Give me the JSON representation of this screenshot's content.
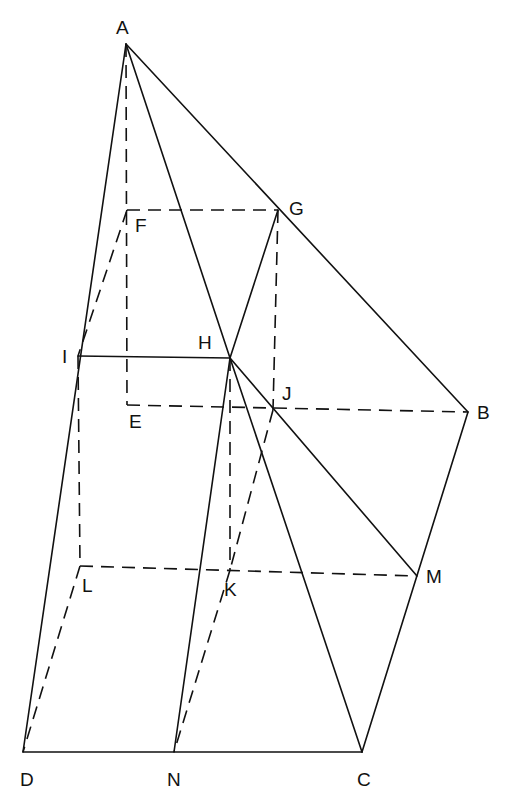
{
  "diagram": {
    "type": "geometric-figure",
    "stroke_color": "#111111",
    "background": "#ffffff",
    "points": [
      {
        "id": "A",
        "label": "A"
      },
      {
        "id": "B",
        "label": "B"
      },
      {
        "id": "C",
        "label": "C"
      },
      {
        "id": "D",
        "label": "D"
      },
      {
        "id": "E",
        "label": "E"
      },
      {
        "id": "F",
        "label": "F"
      },
      {
        "id": "G",
        "label": "G"
      },
      {
        "id": "H",
        "label": "H"
      },
      {
        "id": "I",
        "label": "I"
      },
      {
        "id": "J",
        "label": "J"
      },
      {
        "id": "K",
        "label": "K"
      },
      {
        "id": "L",
        "label": "L"
      },
      {
        "id": "M",
        "label": "M"
      },
      {
        "id": "N",
        "label": "N"
      }
    ],
    "solid_edges": [
      [
        "A",
        "D"
      ],
      [
        "A",
        "B"
      ],
      [
        "A",
        "H"
      ],
      [
        "H",
        "C"
      ],
      [
        "H",
        "M"
      ],
      [
        "H",
        "N"
      ],
      [
        "G",
        "H"
      ],
      [
        "I",
        "H"
      ],
      [
        "B",
        "C"
      ],
      [
        "D",
        "C"
      ]
    ],
    "dashed_edges": [
      [
        "A",
        "E"
      ],
      [
        "F",
        "G"
      ],
      [
        "G",
        "J"
      ],
      [
        "E",
        "B"
      ],
      [
        "F",
        "I"
      ],
      [
        "I",
        "L"
      ],
      [
        "H",
        "K"
      ],
      [
        "L",
        "M"
      ],
      [
        "L",
        "D"
      ],
      [
        "J",
        "K"
      ],
      [
        "K",
        "N"
      ]
    ]
  }
}
